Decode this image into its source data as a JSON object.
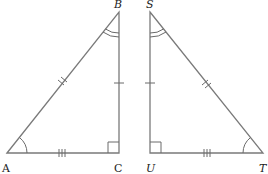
{
  "diagram": {
    "type": "congruent-right-triangles",
    "triangles": [
      {
        "id": "ABC",
        "vertices": [
          {
            "name": "A",
            "label": "A",
            "x": 7,
            "y": 153
          },
          {
            "name": "B",
            "label": "B",
            "x": 119,
            "y": 12
          },
          {
            "name": "C",
            "label": "C",
            "x": 119,
            "y": 153
          }
        ],
        "right_angle_at": "C",
        "angle_marks": {
          "A": "single-arc",
          "B": "double-arc"
        },
        "side_marks": {
          "AB": "double-tick",
          "BC": "single-tick",
          "AC": "triple-tick"
        }
      },
      {
        "id": "STU",
        "vertices": [
          {
            "name": "S",
            "label": "S",
            "x": 150,
            "y": 12
          },
          {
            "name": "T",
            "label": "T",
            "x": 263,
            "y": 153
          },
          {
            "name": "U",
            "label": "U",
            "x": 150,
            "y": 153
          }
        ],
        "right_angle_at": "U",
        "angle_marks": {
          "T": "single-arc",
          "S": "double-arc"
        },
        "side_marks": {
          "ST": "double-tick",
          "SU": "single-tick",
          "UT": "triple-tick"
        }
      }
    ],
    "labels": {
      "A": "A",
      "B": "B",
      "C": "C",
      "S": "S",
      "T": "T",
      "U": "U"
    },
    "colors": {
      "stroke": "#7a7a7a",
      "text": "#222222",
      "background": "#ffffff"
    }
  }
}
